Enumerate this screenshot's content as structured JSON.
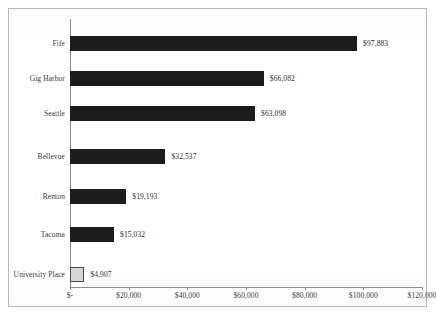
{
  "chart_data": {
    "type": "bar",
    "orientation": "horizontal",
    "title": "",
    "subtitle": "",
    "xlabel": "",
    "ylabel": "",
    "categories": [
      "Fife",
      "Gig Harbor",
      "Seattle",
      "Bellevue",
      "Renton",
      "Tacoma",
      "University Place"
    ],
    "values": [
      97883,
      66082,
      63098,
      32537,
      19193,
      15032,
      4907
    ],
    "value_labels": [
      "$97,883",
      "$66,082",
      "$63,098",
      "$32,537",
      "$19,193",
      "$15,032",
      "$4,907"
    ],
    "bar_styles": [
      "dark",
      "dark",
      "dark",
      "dark",
      "dark",
      "dark",
      "light"
    ],
    "xlim": [
      0,
      120000
    ],
    "xticks": [
      0,
      20000,
      40000,
      60000,
      80000,
      100000,
      120000
    ],
    "xtick_labels": [
      "$-",
      "$20,000",
      "$40,000",
      "$60,000",
      "$80,000",
      "$100,000",
      "$120,000"
    ],
    "grid": false,
    "legend": false,
    "legend_position": "none",
    "colors": {
      "bar_dark": "#1c1c1c",
      "bar_light": "#d6d6d6",
      "bar_light_border": "#4a4a4a",
      "axis": "#8e8e8e",
      "text": "#3a3a3a",
      "frame": "#b9b9b9",
      "background": "#ffffff"
    }
  }
}
